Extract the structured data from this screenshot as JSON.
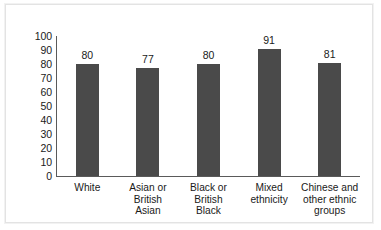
{
  "chart_data": {
    "type": "bar",
    "title": "",
    "subtitle": "",
    "xlabel": "",
    "ylabel": "",
    "ylim": [
      0,
      100
    ],
    "yticks": [
      "100",
      "90",
      "80",
      "70",
      "60",
      "50",
      "40",
      "30",
      "20",
      "10",
      "0"
    ],
    "grid": false,
    "legend": "none",
    "bar_color": "#4a4a4a",
    "axis_color": "#5a5a5a",
    "categories": [
      "White",
      "Asian or British Asian",
      "Black or British Black",
      "Mixed ethnicity",
      "Chinese and other ethnic groups"
    ],
    "category_label_lines": [
      [
        "White"
      ],
      [
        "Asian or",
        "British",
        "Asian"
      ],
      [
        "Black or",
        "British",
        "Black"
      ],
      [
        "Mixed",
        "ethnicity"
      ],
      [
        "Chinese and",
        "other ethnic",
        "groups"
      ]
    ],
    "values": [
      80,
      77,
      80,
      91,
      81
    ],
    "value_labels": [
      "80",
      "77",
      "80",
      "91",
      "81"
    ]
  }
}
